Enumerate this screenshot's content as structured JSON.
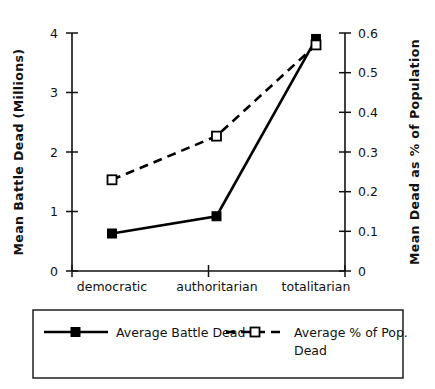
{
  "chart_data": {
    "type": "line",
    "title": "",
    "xlabel": "",
    "categories": [
      "democratic",
      "authoritarian",
      "totalitarian"
    ],
    "grid": false,
    "legend_position": "bottom",
    "ylabel_left": "Mean Battle Dead (Millions)",
    "ylabel_right": "Mean Dead as % of Population",
    "ylim_left": [
      0,
      4
    ],
    "ylim_right": [
      0,
      0.6
    ],
    "yticks_left": [
      "0",
      "1",
      "2",
      "3",
      "4"
    ],
    "yticks_right": [
      "0",
      "0.1",
      "0.2",
      "0.3",
      "0.4",
      "0.5",
      "0.6"
    ],
    "yticks_left_values": [
      0,
      1,
      2,
      3,
      4
    ],
    "yticks_right_values": [
      0,
      0.1,
      0.2,
      0.3,
      0.4,
      0.5,
      0.6
    ],
    "series": [
      {
        "name": "Average Battle Dead",
        "axis": "left",
        "style": "solid",
        "marker": "filled-square",
        "values": [
          0.63,
          0.92,
          3.9
        ]
      },
      {
        "name": "Average % of Pop. Dead",
        "axis": "right",
        "style": "dashed",
        "marker": "open-square",
        "values": [
          0.23,
          0.34,
          0.57
        ]
      }
    ]
  },
  "legend": {
    "entries": [
      {
        "label": "Average Battle Dead"
      },
      {
        "label": "Average % of Pop.",
        "label_line2": "Dead"
      }
    ]
  }
}
